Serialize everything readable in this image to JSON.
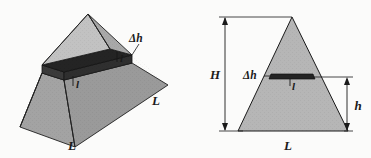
{
  "figure": {
    "background_color": "#fbfbfa",
    "stroke_color": "#1a1a1a"
  },
  "labels": {
    "delta_h": "Δh",
    "slab_width": "l",
    "side_L": "L",
    "base_L": "L",
    "total_height": "H",
    "partial_height": "h"
  },
  "left_panel": {
    "name": "perspective-pyramid",
    "labels": {
      "delta_h": "Δh",
      "slab_width": "l",
      "right_edge_L": "L",
      "front_edge_L": "L"
    },
    "colors": {
      "front_left_face": "#8f8f8f",
      "front_right_face": "#a9a9a9",
      "upper_left_face": "#bdbdbd",
      "upper_right_face": "#b5b5b5",
      "slab_top": "#2a2a2a",
      "slab_side": "#4a4a4a",
      "slab_gap": "#efefef"
    }
  },
  "right_panel": {
    "name": "elevation-triangle",
    "labels": {
      "total_height": "H",
      "delta_h": "Δh",
      "slab_width": "l",
      "partial_height": "h",
      "base_L": "L"
    },
    "colors": {
      "triangle_fill": "#b6b6b6",
      "slab_fill": "#262626"
    }
  }
}
